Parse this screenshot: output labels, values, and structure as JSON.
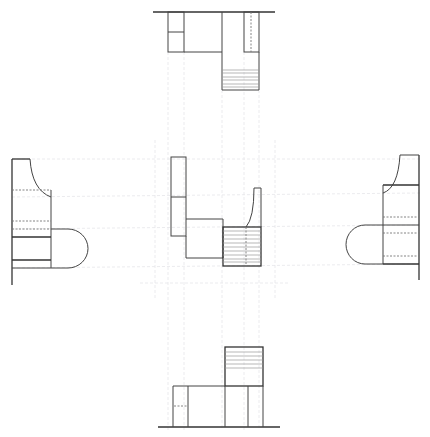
{
  "drawing": {
    "type": "orthographic projection",
    "views": [
      {
        "name": "top-view",
        "label": "Top view"
      },
      {
        "name": "left-view",
        "label": "Left side view"
      },
      {
        "name": "front-view",
        "label": "Front view"
      },
      {
        "name": "right-view",
        "label": "Right side view"
      },
      {
        "name": "bottom-view",
        "label": "Bottom view"
      }
    ],
    "colors": {
      "line": "#444444",
      "hidden": "#777777",
      "construction": "#e6e6ea",
      "background": "#ffffff"
    }
  },
  "watermark": {
    "text": ""
  }
}
